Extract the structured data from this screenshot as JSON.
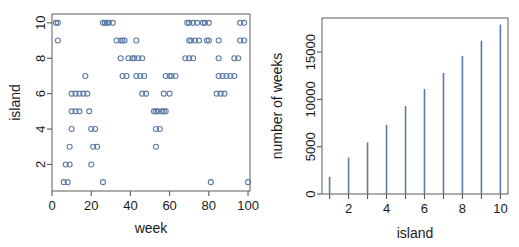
{
  "figure": {
    "title": "",
    "panels": [
      "scatter-island-vs-week",
      "bar-number-of-weeks-per-island"
    ],
    "accent_color": "#5b7ba6",
    "axis_color": "#6b6b6b",
    "background": "#ffffff"
  },
  "chart_data": [
    {
      "type": "scatter",
      "title": "",
      "xlabel": "week",
      "ylabel": "island",
      "xlim": [
        0,
        101
      ],
      "ylim": [
        0.5,
        10.5
      ],
      "xticks": [
        0,
        20,
        40,
        60,
        80,
        100
      ],
      "xticklabels": [
        "0",
        "20",
        "40",
        "60",
        "80",
        "100"
      ],
      "yticks": [
        2,
        4,
        6,
        8,
        10
      ],
      "yticklabels": [
        "2",
        "4",
        "6",
        "8",
        "10"
      ],
      "grid": false,
      "legend": null,
      "marker": "open-circle",
      "color": "#5b7ba6",
      "points": [
        {
          "x": 2,
          "y": 10
        },
        {
          "x": 3,
          "y": 10
        },
        {
          "x": 26,
          "y": 10
        },
        {
          "x": 27,
          "y": 10
        },
        {
          "x": 28,
          "y": 10
        },
        {
          "x": 29,
          "y": 10
        },
        {
          "x": 31,
          "y": 10
        },
        {
          "x": 69,
          "y": 10
        },
        {
          "x": 70,
          "y": 10
        },
        {
          "x": 72,
          "y": 10
        },
        {
          "x": 74,
          "y": 10
        },
        {
          "x": 77,
          "y": 10
        },
        {
          "x": 78,
          "y": 10
        },
        {
          "x": 80,
          "y": 10
        },
        {
          "x": 96,
          "y": 10
        },
        {
          "x": 98,
          "y": 10
        },
        {
          "x": 3,
          "y": 9
        },
        {
          "x": 33,
          "y": 9
        },
        {
          "x": 35,
          "y": 9
        },
        {
          "x": 36,
          "y": 9
        },
        {
          "x": 37,
          "y": 9
        },
        {
          "x": 43,
          "y": 9
        },
        {
          "x": 70,
          "y": 9
        },
        {
          "x": 71,
          "y": 9
        },
        {
          "x": 73,
          "y": 9
        },
        {
          "x": 75,
          "y": 9
        },
        {
          "x": 79,
          "y": 9
        },
        {
          "x": 80,
          "y": 9
        },
        {
          "x": 85,
          "y": 9
        },
        {
          "x": 96,
          "y": 9
        },
        {
          "x": 98,
          "y": 9
        },
        {
          "x": 35,
          "y": 8
        },
        {
          "x": 39,
          "y": 8
        },
        {
          "x": 41,
          "y": 8
        },
        {
          "x": 42,
          "y": 8
        },
        {
          "x": 44,
          "y": 8
        },
        {
          "x": 46,
          "y": 8
        },
        {
          "x": 68,
          "y": 8
        },
        {
          "x": 70,
          "y": 8
        },
        {
          "x": 72,
          "y": 8
        },
        {
          "x": 85,
          "y": 8
        },
        {
          "x": 93,
          "y": 8
        },
        {
          "x": 95,
          "y": 8
        },
        {
          "x": 17,
          "y": 7
        },
        {
          "x": 36,
          "y": 7
        },
        {
          "x": 38,
          "y": 7
        },
        {
          "x": 43,
          "y": 7
        },
        {
          "x": 45,
          "y": 7
        },
        {
          "x": 47,
          "y": 7
        },
        {
          "x": 58,
          "y": 7
        },
        {
          "x": 60,
          "y": 7
        },
        {
          "x": 61,
          "y": 7
        },
        {
          "x": 63,
          "y": 7
        },
        {
          "x": 85,
          "y": 7
        },
        {
          "x": 87,
          "y": 7
        },
        {
          "x": 89,
          "y": 7
        },
        {
          "x": 91,
          "y": 7
        },
        {
          "x": 93,
          "y": 7
        },
        {
          "x": 10,
          "y": 6
        },
        {
          "x": 12,
          "y": 6
        },
        {
          "x": 14,
          "y": 6
        },
        {
          "x": 16,
          "y": 6
        },
        {
          "x": 18,
          "y": 6
        },
        {
          "x": 46,
          "y": 6
        },
        {
          "x": 48,
          "y": 6
        },
        {
          "x": 57,
          "y": 6
        },
        {
          "x": 60,
          "y": 6
        },
        {
          "x": 84,
          "y": 6
        },
        {
          "x": 86,
          "y": 6
        },
        {
          "x": 88,
          "y": 6
        },
        {
          "x": 10,
          "y": 5
        },
        {
          "x": 12,
          "y": 5
        },
        {
          "x": 14,
          "y": 5
        },
        {
          "x": 19,
          "y": 5
        },
        {
          "x": 52,
          "y": 5
        },
        {
          "x": 53,
          "y": 5
        },
        {
          "x": 54,
          "y": 5
        },
        {
          "x": 56,
          "y": 5
        },
        {
          "x": 57,
          "y": 5
        },
        {
          "x": 58,
          "y": 5
        },
        {
          "x": 10,
          "y": 4
        },
        {
          "x": 20,
          "y": 4
        },
        {
          "x": 22,
          "y": 4
        },
        {
          "x": 53,
          "y": 4
        },
        {
          "x": 55,
          "y": 4
        },
        {
          "x": 9,
          "y": 3
        },
        {
          "x": 21,
          "y": 3
        },
        {
          "x": 23,
          "y": 3
        },
        {
          "x": 53,
          "y": 3
        },
        {
          "x": 7,
          "y": 2
        },
        {
          "x": 9,
          "y": 2
        },
        {
          "x": 20,
          "y": 2
        },
        {
          "x": 6,
          "y": 1
        },
        {
          "x": 8,
          "y": 1
        },
        {
          "x": 26,
          "y": 1
        },
        {
          "x": 81,
          "y": 1
        },
        {
          "x": 100,
          "y": 1
        }
      ]
    },
    {
      "type": "bar",
      "title": "",
      "xlabel": "island",
      "ylabel": "number of weeks",
      "categories": [
        1,
        2,
        3,
        4,
        5,
        6,
        7,
        8,
        9,
        10
      ],
      "values": [
        1800,
        3850,
        5450,
        7300,
        9300,
        11100,
        12800,
        14600,
        16200,
        17900
      ],
      "xlim": [
        0.6,
        10.4
      ],
      "ylim": [
        0,
        18600
      ],
      "xticks": [
        1,
        2,
        3,
        4,
        5,
        6,
        7,
        8,
        9,
        10
      ],
      "xticklabels": [
        "",
        "2",
        "",
        "4",
        "",
        "6",
        "",
        "8",
        "",
        "10"
      ],
      "yticks": [
        0,
        5000,
        10000,
        15000
      ],
      "yticklabels": [
        "0",
        "5000",
        "10000",
        "15000"
      ],
      "grid": false,
      "legend": null,
      "color": "#5b7ba6",
      "bar_style": "thin-line"
    }
  ]
}
